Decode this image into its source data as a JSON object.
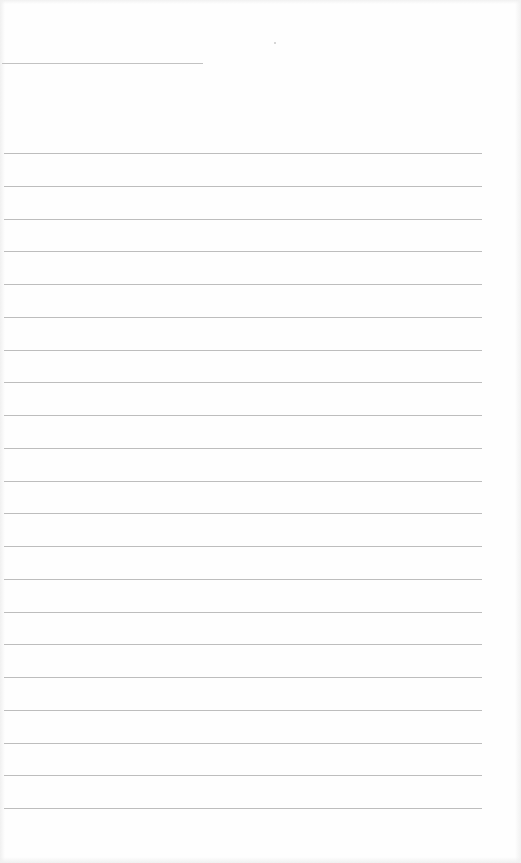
{
  "document": {
    "type": "blank lined form page",
    "header_line": {
      "top": 63,
      "left": 2,
      "width": 201
    },
    "ruled_lines": {
      "count": 21,
      "first_top": 153,
      "spacing": 32.75,
      "left": 4,
      "width": 478
    },
    "colors": {
      "paper": "#fefefe",
      "line": "#bdbdbd",
      "header_line": "#c2c2c2"
    }
  }
}
